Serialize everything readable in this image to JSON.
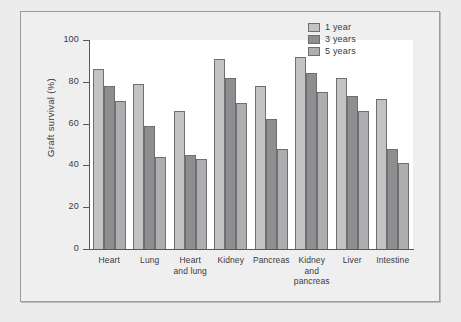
{
  "chart_data": {
    "type": "bar",
    "title": "",
    "xlabel": "",
    "ylabel": "Graft survival (%)",
    "ylim": [
      0,
      100
    ],
    "yticks": [
      0,
      20,
      40,
      60,
      80,
      100
    ],
    "grid": false,
    "legend_position": "top-right",
    "categories": [
      "Heart",
      "Lung",
      "Heart and lung",
      "Kidney",
      "Pancreas",
      "Kidney and pancreas",
      "Liver",
      "Intestine"
    ],
    "category_lines": [
      [
        "Heart"
      ],
      [
        "Lung"
      ],
      [
        "Heart",
        "and lung"
      ],
      [
        "Kidney"
      ],
      [
        "Pancreas"
      ],
      [
        "Kidney",
        "and",
        "pancreas"
      ],
      [
        "Liver"
      ],
      [
        "Intestine"
      ]
    ],
    "series": [
      {
        "name": "1 year",
        "color": "#c3c3c4",
        "values": [
          86,
          79,
          66,
          91,
          78,
          92,
          82,
          72
        ]
      },
      {
        "name": "3 years",
        "color": "#8e8e90",
        "values": [
          78,
          59,
          45,
          82,
          62,
          84,
          73,
          48
        ]
      },
      {
        "name": "5 years",
        "color": "#aeaeb0",
        "values": [
          71,
          44,
          43,
          70,
          48,
          75,
          66,
          41
        ]
      }
    ]
  },
  "legend": {
    "items": [
      {
        "label": "1 year",
        "swatch": "#c3c3c4"
      },
      {
        "label": "3 years",
        "swatch": "#8e8e90"
      },
      {
        "label": "5 years",
        "swatch": "#aeaeb0"
      }
    ]
  }
}
